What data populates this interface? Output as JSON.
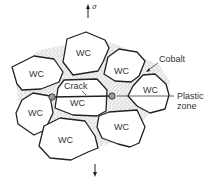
{
  "diagram": {
    "title": "",
    "stress_symbol": "σ",
    "labels": {
      "grain": "WC",
      "crack": "Crack",
      "cobalt": "Cobalt",
      "plastic_zone_line1": "Plastic",
      "plastic_zone_line2": "zone"
    },
    "grains": [
      {
        "id": "top-center",
        "label": "WC"
      },
      {
        "id": "left-upper",
        "label": "WC"
      },
      {
        "id": "right-upper",
        "label": "WC"
      },
      {
        "id": "right",
        "label": "WC"
      },
      {
        "id": "center",
        "label": "WC"
      },
      {
        "id": "left-lower",
        "label": "WC"
      },
      {
        "id": "bottom-center",
        "label": "WC"
      },
      {
        "id": "bottom-right",
        "label": "WC"
      }
    ],
    "colors": {
      "outline": "#222222",
      "matrix_stipple": "#888888",
      "text": "#333333"
    }
  }
}
